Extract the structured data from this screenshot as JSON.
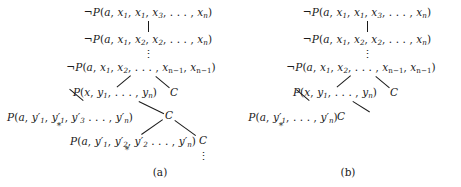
{
  "figure": {
    "panels": [
      {
        "id": "a",
        "caption": "(a)",
        "nodes": [
          {
            "name": "root-clause",
            "text": "¬P(a, x1, x1, x3, . . . , xn)"
          },
          {
            "name": "clause-level-2",
            "text": "¬P(a, x1, x2, x2, . . . , xn)"
          },
          {
            "name": "clause-level-3",
            "text": "¬P(a, x1, x2, . . . , xn−1, xn−1)"
          },
          {
            "name": "clause-p-x-y",
            "text": "P(x, y1, . . . , yn)"
          },
          {
            "name": "clause-c-right-1",
            "text": "C"
          },
          {
            "name": "clause-p-a-yprime-1",
            "text": "P(a, y′1, y′1, y′3 . . . , y′n)"
          },
          {
            "name": "clause-c-right-2",
            "text": "C"
          },
          {
            "name": "clause-p-a-yprime-2",
            "text": "P(a, y′1, y′2, y′2 . . . , y′n)"
          },
          {
            "name": "clause-c-right-3",
            "text": "C"
          }
        ]
      },
      {
        "id": "b",
        "caption": "(b)",
        "nodes": [
          {
            "name": "root-clause",
            "text": "¬P(a, x1, x1, x3, . . . , xn)"
          },
          {
            "name": "clause-level-2",
            "text": "¬P(a, x1, x2, x2, . . . , xn)"
          },
          {
            "name": "clause-level-3",
            "text": "¬P(a, x1, x2, . . . , xn−1, xn−1)"
          },
          {
            "name": "clause-p-x-y",
            "text": "P(x, y1, . . . , yn)"
          },
          {
            "name": "clause-c-right-1",
            "text": "C"
          },
          {
            "name": "clause-p-a-yprime-1",
            "text": "P(a, y′1, . . . , y′n)"
          },
          {
            "name": "clause-c-right-2",
            "text": "C"
          }
        ]
      }
    ],
    "markers": {
      "asterisk": "*",
      "vertical_dots": "⋮"
    }
  }
}
